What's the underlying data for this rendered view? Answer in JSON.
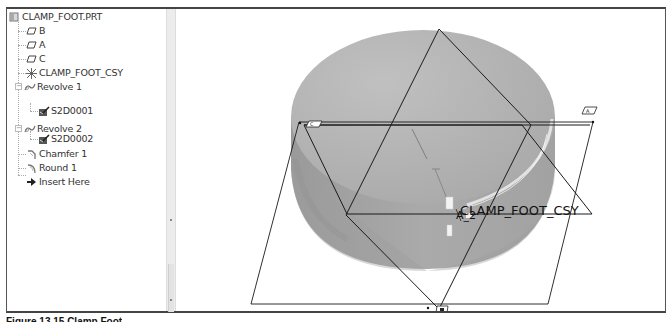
{
  "model_tree": {
    "root": {
      "label": "CLAMP_FOOT.PRT",
      "icon": "part-icon"
    },
    "items": [
      {
        "label": "B",
        "icon": "datum-plane-icon",
        "level": 1
      },
      {
        "label": "A",
        "icon": "datum-plane-icon",
        "level": 1
      },
      {
        "label": "C",
        "icon": "datum-plane-icon",
        "level": 1
      },
      {
        "label": "CLAMP_FOOT_CSY",
        "icon": "coordinate-system-icon",
        "level": 1
      },
      {
        "label": "Revolve 1",
        "icon": "revolve-icon",
        "level": 1,
        "expander": "−"
      },
      {
        "label": "S2D0001",
        "icon": "sketch-icon",
        "level": 2
      },
      {
        "label": "Revolve 2",
        "icon": "revolve-icon",
        "level": 1,
        "expander": "−"
      },
      {
        "label": "S2D0002",
        "icon": "sketch-icon",
        "level": 2
      },
      {
        "label": "Chamfer 1",
        "icon": "chamfer-icon",
        "level": 1
      },
      {
        "label": "Round 1",
        "icon": "round-icon",
        "level": 1
      },
      {
        "label": "Insert Here",
        "icon": "insert-arrow-icon",
        "level": 1
      }
    ]
  },
  "viewport": {
    "csys_label": "CLAMP_FOOT_CSY",
    "axis_label": "A_2",
    "plane_tags": [
      "C",
      "A",
      "B"
    ],
    "colors": {
      "model_fill": "#b4b4b4",
      "model_dark": "#9c9c9c",
      "datum_line": "#1a1a1a",
      "background": "#ffffff"
    }
  },
  "caption": {
    "text": "Figure 13.15 Clamp Foot"
  }
}
